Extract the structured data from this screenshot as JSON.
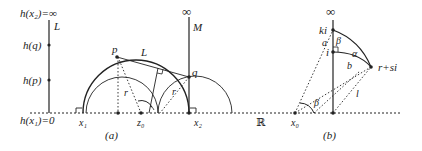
{
  "left_panel": {
    "line_label": "L",
    "top_label": "h(x₂)=∞",
    "hq_label": "h(q)",
    "hp_label": "h(p)",
    "bottom_label": "h(x₁)=0"
  },
  "panel_a": {
    "caption": "(a)",
    "x1": "x₁",
    "x2": "x₂",
    "z0": "z₀",
    "p": "p",
    "q": "q",
    "L": "L",
    "M": "M",
    "infinity": "∞",
    "r_left": "r",
    "r_right": "r"
  },
  "real_axis_label": "ℝ",
  "panel_b": {
    "caption": "(b)",
    "infinity": "∞",
    "ki": "ki",
    "i": "i",
    "point": "r+si",
    "a": "a",
    "b": "b",
    "alpha": "α",
    "beta_top": "β",
    "beta_bottom": "β",
    "l": "l",
    "x0": "x₀"
  },
  "colors": {
    "stroke": "#222222",
    "background": "#ffffff"
  }
}
